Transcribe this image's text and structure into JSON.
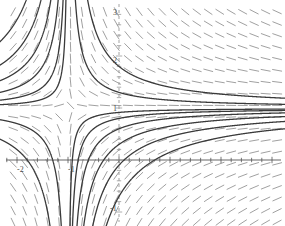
{
  "figure": {
    "type": "slope-field",
    "background_color": "#ffffff",
    "width": 285,
    "height": 226
  },
  "axes": {
    "x_axis": {
      "label": "",
      "color": "#555555",
      "pixel_y": 160,
      "range": [
        -2.33,
        3.25
      ]
    },
    "y_axis": {
      "label": "",
      "color": "#999999",
      "style": "dashed",
      "pixel_x": 119,
      "range": [
        -1.28,
        3.07
      ]
    },
    "origin_px": {
      "x": 119,
      "y": 160
    },
    "unit_px": {
      "x": 51,
      "y": 52
    },
    "x_tick_labels": [
      {
        "text": "-2",
        "value": -2,
        "px_x": 17,
        "px_y": 166
      },
      {
        "text": "-1",
        "value": -1,
        "px_x": 68,
        "px_y": 166
      }
    ],
    "y_tick_labels": [
      {
        "text": "3",
        "value": 3,
        "px_x": 113,
        "px_y": 9
      },
      {
        "text": "2",
        "value": 2,
        "px_x": 113,
        "px_y": 57
      },
      {
        "text": "1",
        "value": 1,
        "px_x": 113,
        "px_y": 105
      },
      {
        "text": "-1",
        "value": -1,
        "px_x": 110,
        "px_y": 205
      }
    ],
    "minor_tick_spacing_units": 0.2,
    "major_tick_spacing_units": 1
  },
  "chart_data": {
    "type": "line",
    "title": "",
    "xlabel": "",
    "ylabel": "",
    "xlim": [
      -2.33,
      3.25
    ],
    "ylim": [
      -1.28,
      3.07
    ],
    "grid": false,
    "legend": "none",
    "slope_field": {
      "description": "short gray line segments showing dy/dx direction on a regular grid",
      "color": "#8f8f8f",
      "segment_length_px": 10,
      "grid_cols": 25,
      "grid_rows": 19,
      "x_start": -2.3,
      "x_step": 0.225,
      "y_start": -1.2,
      "y_step": 0.225,
      "formula": "dy/dx = -(y-1)/(x+1)"
    },
    "series": [
      {
        "name": "solution-curve-1",
        "c": -0.085,
        "color": "#3a3a3a"
      },
      {
        "name": "solution-curve-2",
        "c": -0.2,
        "color": "#3a3a3a"
      },
      {
        "name": "solution-curve-3",
        "c": -0.4,
        "color": "#3a3a3a"
      },
      {
        "name": "solution-curve-4",
        "c": -0.7,
        "color": "#3a3a3a"
      },
      {
        "name": "solution-curve-5",
        "c": -1.1,
        "color": "#3a3a3a"
      },
      {
        "name": "solution-curve-6",
        "c": -1.7,
        "color": "#3a3a3a"
      },
      {
        "name": "solution-curve-7",
        "c": 0.3,
        "color": "#3a3a3a"
      },
      {
        "name": "solution-curve-8",
        "c": 0.8,
        "color": "#3a3a3a"
      }
    ],
    "asymptotes": {
      "horizontal_y": 1,
      "vertical_x": -1
    },
    "curve_color": "#3a3a3a",
    "curve_width_px": 1.3
  }
}
